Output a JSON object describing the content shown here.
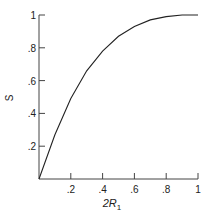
{
  "chart_data": {
    "type": "line",
    "title": "",
    "xlabel": "2R1",
    "ylabel": "S",
    "xlim": [
      0,
      1
    ],
    "ylim": [
      0,
      1
    ],
    "grid": false,
    "x_ticks": [
      ".2",
      ".4",
      ".6",
      ".8",
      "1"
    ],
    "y_ticks": [
      ".2",
      ".4",
      ".6",
      ".8",
      "1"
    ],
    "series": [
      {
        "name": "S",
        "x": [
          0,
          0.1,
          0.2,
          0.3,
          0.4,
          0.5,
          0.6,
          0.7,
          0.8,
          0.9,
          1.0
        ],
        "y": [
          0,
          0.27,
          0.49,
          0.66,
          0.78,
          0.87,
          0.93,
          0.97,
          0.99,
          1.0,
          1.0
        ]
      }
    ]
  },
  "labels": {
    "ylabel": "S",
    "xlabel_main": "2R",
    "xlabel_sub": "1"
  }
}
